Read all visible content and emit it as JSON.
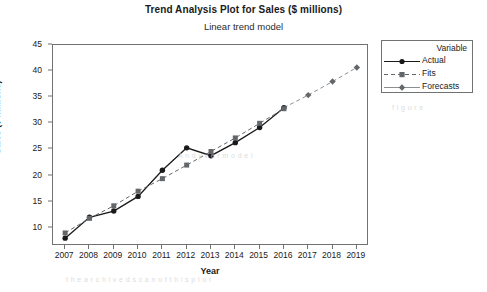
{
  "chart_data": {
    "type": "line",
    "title": "Trend Analysis Plot for Sales ($ millions)",
    "subtitle": "Linear trend model",
    "xlabel": "Year",
    "ylabel": "Sales ($ millions)",
    "x": [
      2007,
      2008,
      2009,
      2010,
      2011,
      2012,
      2013,
      2014,
      2015,
      2016,
      2017,
      2018,
      2019
    ],
    "xticks": [
      "2007",
      "2008",
      "2009",
      "2010",
      "2011",
      "2012",
      "2013",
      "2014",
      "2015",
      "2016",
      "2017",
      "2018",
      "2019"
    ],
    "yticks": [
      "10",
      "15",
      "20",
      "25",
      "30",
      "35",
      "40",
      "45"
    ],
    "ylim": [
      6.5,
      45
    ],
    "xlim": [
      2006.5,
      2019.5
    ],
    "grid": false,
    "legend_position": "right",
    "legend_title": "Variable",
    "series": [
      {
        "name": "Actual",
        "style": "solid",
        "marker": "circle",
        "color": "#1a1a1a",
        "x": [
          2007,
          2008,
          2009,
          2010,
          2011,
          2012,
          2013,
          2014,
          2015,
          2016
        ],
        "values": [
          8.0,
          12.0,
          13.2,
          16.0,
          21.0,
          25.3,
          23.8,
          26.3,
          29.2,
          33.0
        ]
      },
      {
        "name": "Fits",
        "style": "dashed",
        "marker": "square",
        "color": "#63676a",
        "x": [
          2007,
          2008,
          2009,
          2010,
          2011,
          2012,
          2013,
          2014,
          2015,
          2016
        ],
        "values": [
          9.0,
          11.8,
          14.2,
          17.0,
          19.4,
          22.0,
          24.6,
          27.2,
          30.0,
          32.8
        ]
      },
      {
        "name": "Forecasts",
        "style": "dashed",
        "marker": "diamond",
        "color": "#63676a",
        "x": [
          2017,
          2018,
          2019
        ],
        "values": [
          35.4,
          38.0,
          40.7
        ]
      }
    ],
    "annotations": []
  },
  "legend": {
    "title": "Variable",
    "items": [
      {
        "label": "Actual"
      },
      {
        "label": "Fits"
      },
      {
        "label": "Forecasts"
      }
    ]
  },
  "artifacts": [
    {
      "text": "A n d y  v e r  m o d e l",
      "left": 178,
      "top": 152
    },
    {
      "text": "t h e  a r c h i v e d  s c a n  o f  t h i s  p l o t",
      "left": 66,
      "top": 276
    },
    {
      "text": "f i g u r e",
      "left": 392,
      "top": 104
    }
  ]
}
